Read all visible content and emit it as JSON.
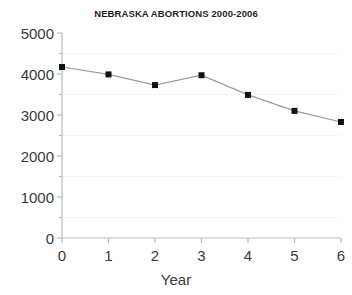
{
  "chart_data": {
    "type": "line",
    "title": "NEBRASKA ABORTIONS 2000-2006",
    "xlabel": "Year",
    "ylabel": "",
    "x": [
      0,
      1,
      2,
      3,
      4,
      5,
      6
    ],
    "values": [
      4170,
      3990,
      3730,
      3970,
      3490,
      3100,
      2830
    ],
    "series": [
      {
        "name": "Abortions",
        "values": [
          4170,
          3990,
          3730,
          3970,
          3490,
          3100,
          2830
        ]
      }
    ],
    "xtick_labels": [
      "0",
      "1",
      "2",
      "3",
      "4",
      "5",
      "6"
    ],
    "ytick_labels": [
      "0",
      "1000",
      "2000",
      "3000",
      "4000",
      "5000"
    ],
    "ytick_values": [
      0,
      1000,
      2000,
      3000,
      4000,
      5000
    ],
    "xlim": [
      0,
      6
    ],
    "ylim": [
      0,
      5000
    ],
    "grid": true,
    "gridlines_y": [
      500,
      1500,
      2500,
      3500,
      4500
    ],
    "legend": "none",
    "marker": "square",
    "marker_color": "#111111",
    "line_color": "#9a9a9a",
    "grid_color": "#e8e8ee",
    "axis_color": "#b9b9b9",
    "text_color": "#3a3a3a",
    "background": "#ffffff"
  }
}
